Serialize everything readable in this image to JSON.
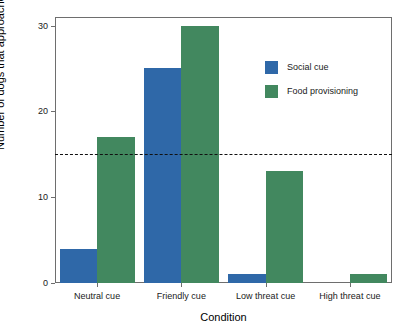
{
  "chart_data": {
    "type": "bar",
    "title": "",
    "subtitle": "",
    "xlabel": "Condition",
    "ylabel": "Number of dogs that approached",
    "categories": [
      "Neutral cue",
      "Friendly cue",
      "Low threat cue",
      "High threat cue"
    ],
    "series": [
      {
        "name": "Social cue",
        "color": "#2f68a8",
        "values": [
          4,
          25,
          1,
          0
        ]
      },
      {
        "name": "Food provisioning",
        "color": "#42885f",
        "values": [
          17,
          30,
          13,
          1
        ]
      }
    ],
    "ylim": [
      0,
      31
    ],
    "yticks": [
      0,
      10,
      20,
      30
    ],
    "ytick_labels": [
      "0",
      "10",
      "20",
      "30"
    ],
    "xlim": [
      0,
      4
    ],
    "grid": false,
    "legend_position": "upper right",
    "annotations": [
      {
        "type": "hline",
        "name": "threshold-line",
        "value": 15,
        "style": "dashed",
        "color": "#111111"
      }
    ]
  },
  "axes": {
    "y_title": "Number of dogs that approached",
    "x_title": "Condition"
  },
  "legend": {
    "entries": [
      {
        "label": "Social cue",
        "color": "#2f68a8"
      },
      {
        "label": "Food provisioning",
        "color": "#42885f"
      }
    ]
  }
}
